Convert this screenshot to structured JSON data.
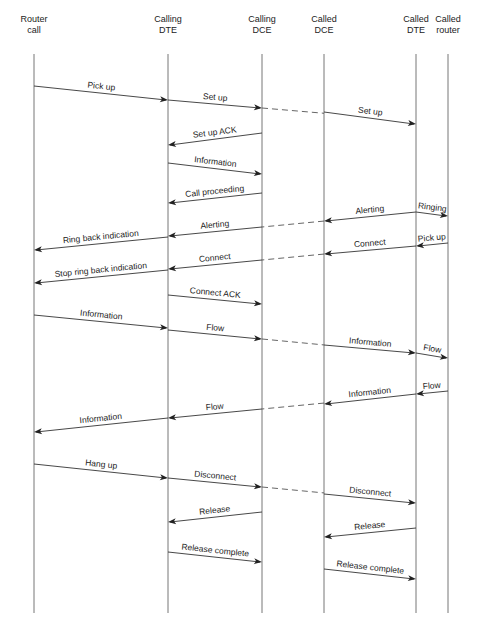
{
  "diagram": {
    "type": "sequence",
    "participants": [
      {
        "id": "router_call",
        "lines": [
          "Router",
          "call"
        ]
      },
      {
        "id": "calling_dte",
        "lines": [
          "Calling",
          "DTE"
        ]
      },
      {
        "id": "calling_dce",
        "lines": [
          "Calling",
          "DCE"
        ]
      },
      {
        "id": "called_dce",
        "lines": [
          "Called",
          "DCE"
        ]
      },
      {
        "id": "called_dte",
        "lines": [
          "Called",
          "DTE"
        ]
      },
      {
        "id": "called_router",
        "lines": [
          "Called",
          "router"
        ]
      }
    ],
    "messages": [
      {
        "label": "Pick up",
        "from": "router_call",
        "to": "calling_dte",
        "step": 0
      },
      {
        "label": "Set up",
        "from": "calling_dte",
        "to": "calling_dce",
        "step": 1,
        "continues_to": "called_dce"
      },
      {
        "label": "Set up",
        "from": "called_dce",
        "to": "called_dte",
        "step": 2
      },
      {
        "label": "Set up ACK",
        "from": "calling_dce",
        "to": "calling_dte",
        "step": 3
      },
      {
        "label": "Information",
        "from": "calling_dte",
        "to": "calling_dce",
        "step": 4
      },
      {
        "label": "Call proceeding",
        "from": "calling_dce",
        "to": "calling_dte",
        "step": 5
      },
      {
        "label": "Ringing",
        "from": "called_dte",
        "to": "called_router",
        "step": 6
      },
      {
        "label": "Alerting",
        "from": "called_dte",
        "to": "called_dce",
        "step": 6
      },
      {
        "label": "Alerting",
        "from": "calling_dce",
        "to": "calling_dte",
        "step": 7,
        "continues_from": "called_dce"
      },
      {
        "label": "Ring back indication",
        "from": "calling_dte",
        "to": "router_call",
        "step": 8
      },
      {
        "label": "Pick up",
        "from": "called_router",
        "to": "called_dte",
        "step": 8
      },
      {
        "label": "Connect",
        "from": "called_dte",
        "to": "called_dce",
        "step": 9
      },
      {
        "label": "Connect",
        "from": "calling_dce",
        "to": "calling_dte",
        "step": 10,
        "continues_from": "called_dce"
      },
      {
        "label": "Stop ring back indication",
        "from": "calling_dte",
        "to": "router_call",
        "step": 11
      },
      {
        "label": "Connect ACK",
        "from": "calling_dte",
        "to": "calling_dce",
        "step": 12
      },
      {
        "label": "Information",
        "from": "router_call",
        "to": "calling_dte",
        "step": 13
      },
      {
        "label": "Flow",
        "from": "calling_dte",
        "to": "calling_dce",
        "step": 14,
        "continues_to": "called_dce"
      },
      {
        "label": "Information",
        "from": "called_dce",
        "to": "called_dte",
        "step": 15
      },
      {
        "label": "Flow",
        "from": "called_dte",
        "to": "called_router",
        "step": 16
      },
      {
        "label": "Flow",
        "from": "called_router",
        "to": "called_dte",
        "step": 17
      },
      {
        "label": "Information",
        "from": "called_dte",
        "to": "called_dce",
        "step": 18
      },
      {
        "label": "Flow",
        "from": "calling_dce",
        "to": "calling_dte",
        "step": 19,
        "continues_from": "called_dce"
      },
      {
        "label": "Information",
        "from": "calling_dte",
        "to": "router_call",
        "step": 20
      },
      {
        "label": "Hang up",
        "from": "router_call",
        "to": "calling_dte",
        "step": 21
      },
      {
        "label": "Disconnect",
        "from": "calling_dte",
        "to": "calling_dce",
        "step": 22,
        "continues_to": "called_dce"
      },
      {
        "label": "Disconnect",
        "from": "called_dce",
        "to": "called_dte",
        "step": 23
      },
      {
        "label": "Release",
        "from": "calling_dce",
        "to": "calling_dte",
        "step": 24
      },
      {
        "label": "Release",
        "from": "called_dte",
        "to": "called_dce",
        "step": 25
      },
      {
        "label": "Release complete",
        "from": "calling_dte",
        "to": "calling_dce",
        "step": 26
      },
      {
        "label": "Release complete",
        "from": "called_dce",
        "to": "called_dte",
        "step": 27
      }
    ]
  }
}
